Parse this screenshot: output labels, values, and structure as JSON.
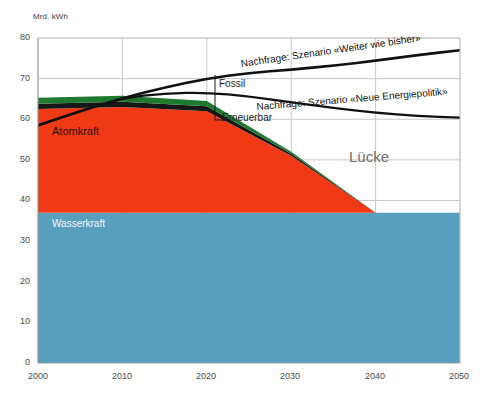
{
  "chart_data": {
    "type": "area",
    "title": "",
    "subtitle": "",
    "ylabel": "Mrd. kWh",
    "xlabel": "",
    "xlim": [
      2000,
      2050
    ],
    "ylim": [
      0,
      80
    ],
    "yticks": [
      0,
      10,
      20,
      30,
      40,
      50,
      60,
      70,
      80
    ],
    "xticks": [
      2000,
      2010,
      2020,
      2030,
      2040,
      2050
    ],
    "grid": true,
    "legend_position": "inline-annotations",
    "stacked_series": [
      {
        "name": "Wasserkraft",
        "color": "#589ebd",
        "label_color": "#f2f7fa",
        "x": [
          2000,
          2010,
          2020,
          2030,
          2040,
          2050
        ],
        "values": [
          37,
          37,
          37,
          37,
          37,
          37
        ]
      },
      {
        "name": "Atomkraft",
        "color": "#f03a15",
        "label_color": "#2b1208",
        "x": [
          2000,
          2010,
          2020,
          2030,
          2040,
          2050
        ],
        "values": [
          25.5,
          26,
          25,
          14,
          0,
          0
        ]
      },
      {
        "name": "Fossil",
        "color": "#171717",
        "label_color": "#1a1a1a",
        "x": [
          2000,
          2010,
          2020,
          2030,
          2040,
          2050
        ],
        "values": [
          1.3,
          1.3,
          1.2,
          0.5,
          0,
          0
        ]
      },
      {
        "name": "Erneuerbar",
        "color": "#1f7a30",
        "label_color": "#1a1a1a",
        "x": [
          2000,
          2010,
          2020,
          2030,
          2040,
          2050
        ],
        "values": [
          1.5,
          1.5,
          1.3,
          0.5,
          0,
          0
        ]
      }
    ],
    "line_series": [
      {
        "name": "Nachfrage: Szenario «Weiter wie bisher»",
        "color": "#111111",
        "x": [
          2000,
          2005,
          2010,
          2015,
          2020,
          2025,
          2030,
          2035,
          2040,
          2045,
          2050
        ],
        "values": [
          58.5,
          62.0,
          65.2,
          67.8,
          70.0,
          71.4,
          72.2,
          73.2,
          74.4,
          75.8,
          77.0
        ]
      },
      {
        "name": "Nachfrage: Szenario «Neue Energiepolitik»",
        "color": "#111111",
        "x": [
          2000,
          2005,
          2010,
          2015,
          2020,
          2025,
          2030,
          2035,
          2040,
          2045,
          2050
        ],
        "values": [
          58.5,
          62.0,
          65.2,
          66.4,
          66.6,
          65.6,
          64.2,
          62.8,
          61.6,
          60.8,
          60.4
        ]
      }
    ],
    "annotations": [
      {
        "text": "Atomkraft",
        "x": 2002,
        "y": 58,
        "role": "area-label"
      },
      {
        "text": "Wasserkraft",
        "x": 2002,
        "y": 35,
        "role": "area-label"
      },
      {
        "text": "Fossil",
        "x": 2022,
        "y": 70.5,
        "role": "callout-label"
      },
      {
        "text": "Erneuerbar",
        "x": 2022,
        "y": 62.5,
        "role": "callout-label"
      },
      {
        "text": "Lücke",
        "x": 2037,
        "y": 52,
        "role": "gap-label"
      },
      {
        "text": "Nachfrage: Szenario «Weiter wie bisher»",
        "x": 2023,
        "y": 75,
        "role": "curve-label"
      },
      {
        "text": "Nachfrage: Szenario «Neue Energiepolitik»",
        "x": 2026,
        "y": 66,
        "role": "curve-label"
      }
    ]
  },
  "axes": {
    "unit_label": "Mrd. kWh",
    "y_tick_labels": [
      "80",
      "70",
      "60",
      "50",
      "40",
      "30",
      "20",
      "10",
      "0"
    ],
    "x_tick_labels": [
      "2000",
      "2010",
      "2020",
      "2030",
      "2040",
      "2050"
    ]
  },
  "labels": {
    "atomkraft": "Atomkraft",
    "wasserkraft": "Wasserkraft",
    "fossil": "Fossil",
    "erneuerbar": "Erneuerbar",
    "luecke": "Lücke",
    "demand_business_as_usual": "Nachfrage: Szenario «Weiter wie bisher»",
    "demand_new_policy": "Nachfrage: Szenario «Neue Energiepolitik»"
  },
  "colors": {
    "wasserkraft": "#589ebd",
    "atomkraft": "#f03a15",
    "fossil": "#171717",
    "erneuerbar": "#1f7a30",
    "line": "#111111",
    "grid": "#c8c8c8",
    "axis_text": "#4a4a4a"
  }
}
